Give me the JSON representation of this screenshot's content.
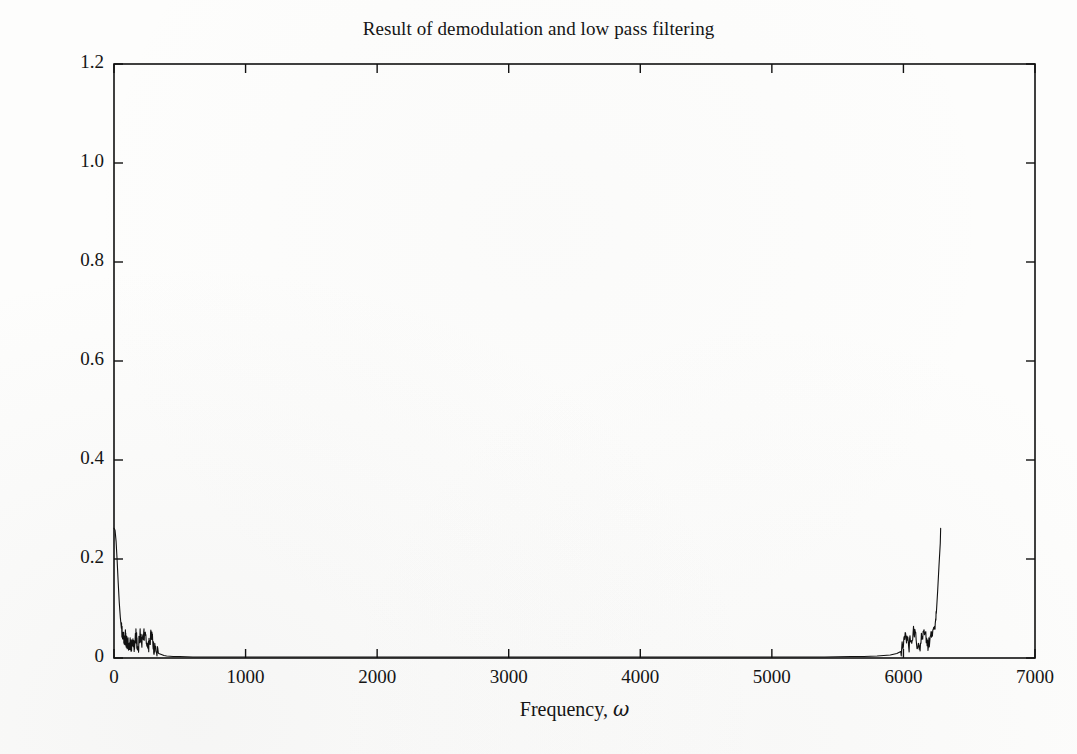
{
  "figure": {
    "title": "Result of demodulation and low pass filtering",
    "background_color": "#fdfdfc",
    "ink_color": "#151515"
  },
  "chart_data": {
    "type": "line",
    "title": "Result of demodulation and low pass filtering",
    "xlabel": "Frequency, ω",
    "ylabel": "Amplitude",
    "xlim": [
      0,
      7000
    ],
    "ylim": [
      0,
      1.2
    ],
    "xticks": [
      0,
      1000,
      2000,
      3000,
      4000,
      5000,
      6000,
      7000
    ],
    "xtick_labels": [
      "0",
      "1000",
      "2000",
      "3000",
      "4000",
      "5000",
      "6000",
      "7000"
    ],
    "yticks": [
      0,
      0.2,
      0.4,
      0.6,
      0.8,
      1.0,
      1.2
    ],
    "ytick_labels": [
      "0",
      "0.2",
      "0.4",
      "0.6",
      "0.8",
      "1.0",
      "1.2"
    ],
    "grid": false,
    "legend": false,
    "tick_direction": "in",
    "frame": "box",
    "line_color": "#111111",
    "line_width": 1.1,
    "annotations": [
      "Sharp low-frequency spike at ω ≈ 0 reaching amplitude ≈ 0.26",
      "Mirror spike near Nyquist at ω ≈ 6285 reaching amplitude ≈ 0.26",
      "Noise shelf with amplitude ≤ 0.05 between ω ≈ 60 and ω ≈ 320",
      "Mirrored noise shelf between ω ≈ 5980 and ω ≈ 6230",
      "Flat near-zero baseline across the passband 400 ≤ ω ≤ 5900"
    ],
    "series": [
      {
        "name": "Demodulated low-pass filtered spectrum",
        "x": [
          0,
          8,
          16,
          24,
          32,
          40,
          48,
          56,
          64,
          72,
          80,
          88,
          96,
          104,
          112,
          120,
          128,
          136,
          144,
          152,
          160,
          168,
          176,
          184,
          192,
          200,
          212,
          224,
          236,
          248,
          260,
          272,
          284,
          296,
          308,
          320,
          340,
          360,
          380,
          400,
          450,
          500,
          600,
          700,
          800,
          900,
          1000,
          1200,
          1400,
          1600,
          1800,
          2000,
          2200,
          2400,
          2600,
          2800,
          3000,
          3200,
          3400,
          3600,
          3800,
          4000,
          4200,
          4400,
          4600,
          4800,
          5000,
          5200,
          5400,
          5600,
          5700,
          5800,
          5900,
          5950,
          5980,
          6000,
          6020,
          6040,
          6060,
          6080,
          6100,
          6120,
          6140,
          6160,
          6180,
          6200,
          6220,
          6240,
          6250,
          6260,
          6270,
          6280,
          6283
        ],
        "y": [
          0.262,
          0.258,
          0.235,
          0.196,
          0.152,
          0.112,
          0.082,
          0.06,
          0.046,
          0.038,
          0.032,
          0.041,
          0.028,
          0.034,
          0.022,
          0.03,
          0.018,
          0.026,
          0.039,
          0.021,
          0.033,
          0.044,
          0.026,
          0.017,
          0.035,
          0.048,
          0.022,
          0.037,
          0.051,
          0.028,
          0.019,
          0.033,
          0.046,
          0.024,
          0.014,
          0.012,
          0.009,
          0.007,
          0.005,
          0.004,
          0.003,
          0.003,
          0.002,
          0.002,
          0.002,
          0.002,
          0.002,
          0.002,
          0.002,
          0.002,
          0.002,
          0.002,
          0.002,
          0.002,
          0.002,
          0.002,
          0.002,
          0.002,
          0.002,
          0.002,
          0.002,
          0.002,
          0.002,
          0.002,
          0.002,
          0.002,
          0.002,
          0.002,
          0.002,
          0.003,
          0.003,
          0.004,
          0.006,
          0.009,
          0.013,
          0.024,
          0.041,
          0.022,
          0.035,
          0.05,
          0.027,
          0.018,
          0.038,
          0.047,
          0.025,
          0.033,
          0.044,
          0.058,
          0.09,
          0.135,
          0.185,
          0.232,
          0.262
        ]
      }
    ]
  },
  "axis": {
    "ylabel": "Amplitude",
    "xlabel_text": "Frequency,",
    "xlabel_symbol": "ω"
  }
}
